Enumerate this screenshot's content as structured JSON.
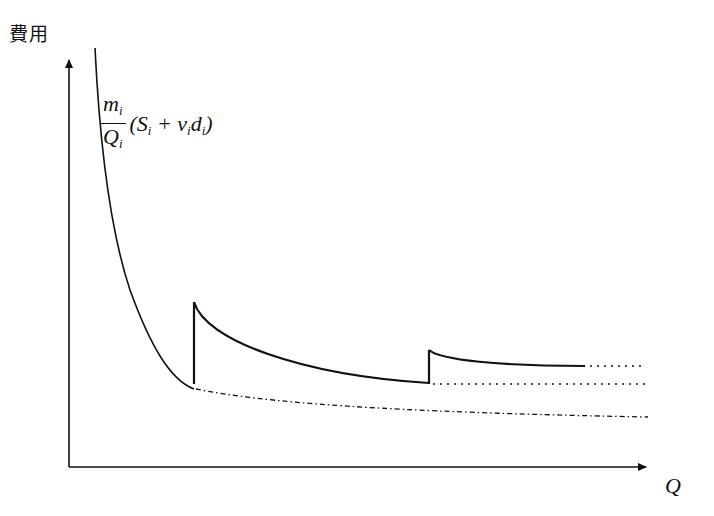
{
  "figure": {
    "y_axis_label": "費用",
    "x_axis_label": "Q",
    "formula": {
      "numerator": "m",
      "numerator_sub": "i",
      "denominator": "Q",
      "denominator_sub": "i",
      "rest_open": "(S",
      "rest_s_sub": "i",
      "rest_plus": " + v",
      "rest_v_sub": "i",
      "rest_d": "d",
      "rest_d_sub": "i",
      "rest_close": ")"
    }
  },
  "colors": {
    "line": "#111111",
    "background": "#ffffff"
  },
  "diagram": {
    "axes": {
      "origin": [
        69,
        467
      ],
      "x_end": [
        648,
        467
      ],
      "y_end": [
        69,
        58
      ]
    },
    "segments": [
      {
        "name": "curve-1",
        "style": "solid",
        "from": [
          95,
          48
        ],
        "to": [
          194,
          389
        ]
      },
      {
        "name": "jump-1",
        "style": "solid",
        "from": [
          194,
          389
        ],
        "to": [
          194,
          302
        ]
      },
      {
        "name": "curve-2",
        "style": "solid",
        "from": [
          194,
          302
        ],
        "to": [
          429,
          383
        ]
      },
      {
        "name": "jump-2",
        "style": "solid",
        "from": [
          429,
          383
        ],
        "to": [
          429,
          350
        ]
      },
      {
        "name": "curve-3",
        "style": "solid",
        "from": [
          429,
          350
        ],
        "to": [
          585,
          366
        ]
      },
      {
        "name": "extension-3",
        "style": "dotted",
        "from": [
          590,
          366
        ],
        "to": [
          644,
          366
        ]
      },
      {
        "name": "extension-2",
        "style": "dotted",
        "from": [
          432,
          384
        ],
        "to": [
          644,
          384
        ]
      },
      {
        "name": "base-curve",
        "style": "dash-dot",
        "from": [
          194,
          389
        ],
        "to": [
          648,
          417
        ]
      }
    ]
  }
}
